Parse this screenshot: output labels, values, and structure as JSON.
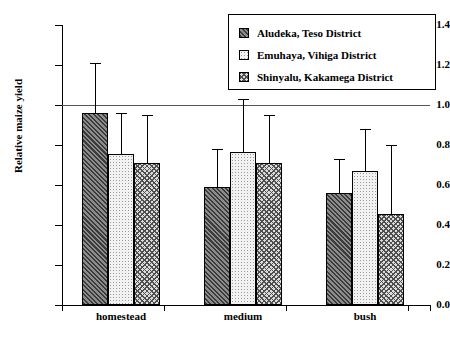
{
  "chart_data": {
    "type": "bar",
    "title": "",
    "xlabel": "",
    "ylabel": "Relative maize yield",
    "categories": [
      "homestead",
      "medium",
      "bush"
    ],
    "ylim": [
      0.0,
      1.4
    ],
    "yticks": [
      "0.0",
      "0.2",
      "0.4",
      "0.6",
      "0.8",
      "1.0",
      "1.2",
      "1.4"
    ],
    "grid": false,
    "legend_position": "top-right",
    "reference_line": 1.0,
    "series": [
      {
        "name": "Aludeka, Teso District",
        "pattern": "diagonal-hatch",
        "values": [
          0.96,
          0.59,
          0.56
        ],
        "errors_upper": [
          1.21,
          0.78,
          0.73
        ]
      },
      {
        "name": "Emuhaya, Vihiga District",
        "pattern": "dotted-stipple",
        "values": [
          0.755,
          0.765,
          0.67
        ],
        "errors_upper": [
          0.96,
          1.03,
          0.88
        ]
      },
      {
        "name": "Shinyalu, Kakamega District",
        "pattern": "cross-hatch",
        "values": [
          0.71,
          0.71,
          0.455
        ],
        "errors_upper": [
          0.95,
          0.95,
          0.8
        ]
      }
    ]
  }
}
